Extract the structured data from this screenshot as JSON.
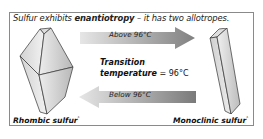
{
  "headline": {
    "prefix": "Sulfur exhibits ",
    "term": "enantiotropy",
    "suffix": " – it has two allotropes."
  },
  "arrows": {
    "forward": {
      "label": "Above 96°C",
      "direction": "right"
    },
    "backward": {
      "label": "Below 96°C",
      "direction": "left"
    }
  },
  "transition": {
    "line1": "Transition",
    "line2_bold": "temperature",
    "line2_rest": " = 96°C"
  },
  "allotropes": {
    "left": {
      "name": "Rhombic sulfur",
      "mark": "*"
    },
    "right": {
      "name": "Monoclinic sulfur",
      "mark": "*"
    }
  },
  "colors": {
    "border": "#8a8a8a",
    "arrow_dark": "#8a8a8a",
    "arrow_light": "#e6e6e6",
    "crystal_face_light": "#e4e4e4",
    "crystal_face_dark": "#bdbdbd"
  }
}
